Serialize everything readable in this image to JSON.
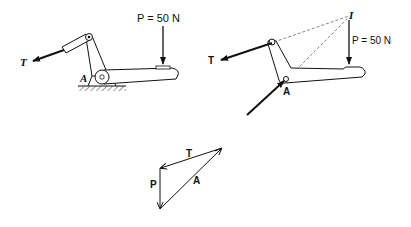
{
  "figure_left": {
    "title": "Pedal mechanism with ground support",
    "force_p_label": "P = 50 N",
    "force_t_label": "T",
    "pin_label": "A"
  },
  "figure_right": {
    "title": "Free-body diagram of pedal",
    "force_p_label": "P = 50 N",
    "force_t_label": "T",
    "pin_label": "A",
    "intersection_label": "I"
  },
  "force_triangle": {
    "labels": {
      "t": "T",
      "p": "P",
      "a": "A"
    }
  },
  "colors": {
    "ink": "#111111",
    "dashed": "#555555",
    "background": "#ffffff"
  }
}
